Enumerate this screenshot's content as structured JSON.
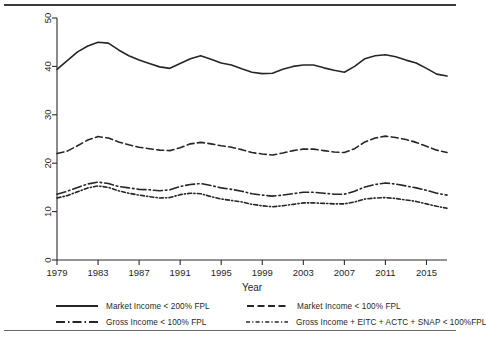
{
  "chart_data": {
    "type": "line",
    "title": "",
    "subtitle": "",
    "xlabel": "Year",
    "ylabel": "Percent",
    "xlim": [
      1979,
      2017
    ],
    "ylim": [
      0,
      50
    ],
    "xticks": [
      1979,
      1983,
      1987,
      1991,
      1995,
      1999,
      2003,
      2007,
      2011,
      2015
    ],
    "yticks": [
      0,
      10,
      20,
      30,
      40,
      50
    ],
    "grid": false,
    "legend_position": "bottom",
    "x": [
      1979,
      1980,
      1981,
      1982,
      1983,
      1984,
      1985,
      1986,
      1987,
      1988,
      1989,
      1990,
      1991,
      1992,
      1993,
      1994,
      1995,
      1996,
      1997,
      1998,
      1999,
      2000,
      2001,
      2002,
      2003,
      2004,
      2005,
      2006,
      2007,
      2008,
      2009,
      2010,
      2011,
      2012,
      2013,
      2014,
      2015,
      2016,
      2017
    ],
    "series": [
      {
        "name": "Market Income < 200% FPL",
        "dash": "solid",
        "values": [
          39.4,
          41.2,
          43.0,
          44.2,
          45.0,
          44.8,
          43.4,
          42.2,
          41.3,
          40.6,
          39.9,
          39.6,
          40.6,
          41.6,
          42.2,
          41.5,
          40.7,
          40.3,
          39.5,
          38.8,
          38.5,
          38.6,
          39.4,
          40.0,
          40.3,
          40.3,
          39.7,
          39.2,
          38.8,
          40.0,
          41.6,
          42.2,
          42.4,
          42.0,
          41.3,
          40.7,
          39.6,
          38.4,
          38.0
        ]
      },
      {
        "name": "Market Income < 100% FPL",
        "dash": "dashed",
        "values": [
          22.0,
          22.5,
          23.6,
          24.8,
          25.5,
          25.2,
          24.4,
          23.8,
          23.3,
          23.0,
          22.7,
          22.6,
          23.2,
          24.0,
          24.3,
          24.0,
          23.6,
          23.3,
          22.8,
          22.2,
          21.9,
          21.7,
          22.1,
          22.6,
          22.9,
          22.9,
          22.6,
          22.3,
          22.2,
          23.0,
          24.4,
          25.2,
          25.6,
          25.3,
          24.9,
          24.3,
          23.5,
          22.7,
          22.2
        ]
      },
      {
        "name": "Gross Income < 100% FPL",
        "dash": "dashdot",
        "values": [
          13.6,
          14.2,
          15.0,
          15.7,
          16.1,
          15.8,
          15.2,
          14.9,
          14.6,
          14.5,
          14.3,
          14.5,
          15.2,
          15.6,
          15.8,
          15.4,
          14.9,
          14.6,
          14.2,
          13.7,
          13.4,
          13.2,
          13.4,
          13.7,
          14.0,
          14.0,
          13.8,
          13.6,
          13.6,
          14.2,
          15.1,
          15.6,
          15.9,
          15.7,
          15.3,
          14.9,
          14.4,
          13.8,
          13.4
        ]
      },
      {
        "name": "Gross Income + EITC + ACTC + SNAP < 100%FPL",
        "dash": "dotted",
        "values": [
          12.8,
          13.3,
          14.1,
          14.9,
          15.3,
          15.0,
          14.3,
          13.8,
          13.4,
          13.1,
          12.8,
          12.9,
          13.5,
          13.8,
          13.7,
          13.1,
          12.6,
          12.3,
          12.0,
          11.5,
          11.2,
          11.0,
          11.2,
          11.5,
          11.8,
          11.8,
          11.7,
          11.6,
          11.6,
          12.0,
          12.6,
          12.8,
          12.9,
          12.7,
          12.4,
          12.1,
          11.6,
          11.1,
          10.7
        ]
      }
    ]
  },
  "legend": {
    "items": [
      {
        "label": "Market Income < 200% FPL",
        "dash": "solid"
      },
      {
        "label": "Market Income < 100% FPL",
        "dash": "dashed"
      },
      {
        "label": "Gross Income < 100% FPL",
        "dash": "dashdot"
      },
      {
        "label": "Gross Income + EITC + ACTC + SNAP < 100%FPL",
        "dash": "dotted"
      }
    ]
  },
  "colors": {
    "line": "#262626",
    "axis": "#2b2b2b",
    "text": "#1f1f1f",
    "background": "#ffffff"
  }
}
